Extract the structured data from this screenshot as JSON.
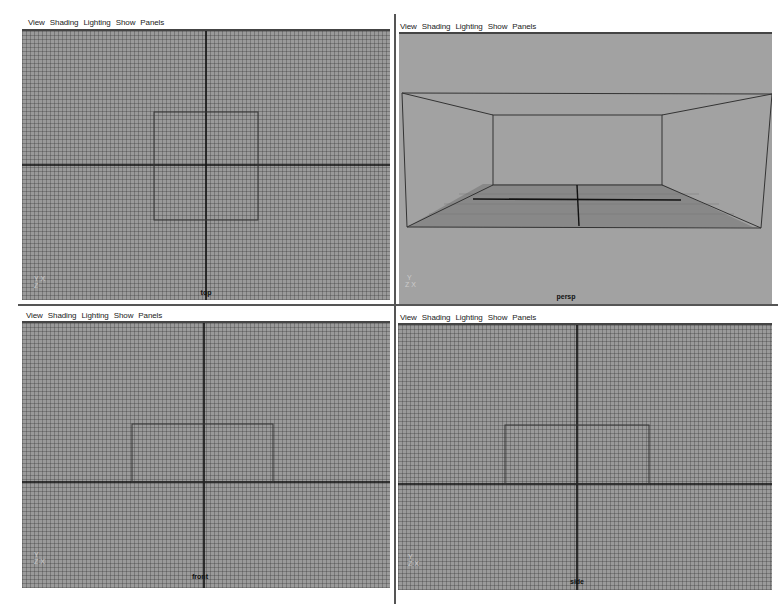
{
  "menu": [
    "View",
    "Shading",
    "Lighting",
    "Show",
    "Panels"
  ],
  "panels": [
    {
      "id": "top",
      "camera_label": "top",
      "gizmo": "Y X\nZ"
    },
    {
      "id": "persp",
      "camera_label": "persp",
      "gizmo": "Y\nZ X"
    },
    {
      "id": "front",
      "camera_label": "front",
      "gizmo": "Y\nZ X"
    },
    {
      "id": "side",
      "camera_label": "side",
      "gizmo": "Y\nZ X"
    }
  ],
  "colors": {
    "viewport_bg": "#9a9a9a",
    "wire": "#333333",
    "axis": "#111111"
  }
}
